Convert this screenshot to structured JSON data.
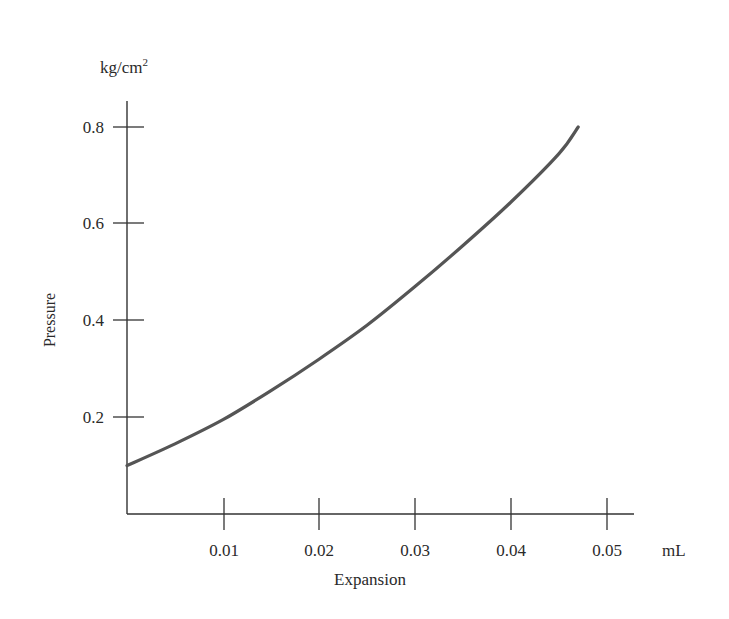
{
  "chart_data": {
    "type": "line",
    "title": "",
    "xlabel": "Expansion",
    "ylabel": "Pressure",
    "x_unit": "mL",
    "y_unit": "kg/cm²",
    "y_unit_base": "kg/cm",
    "y_unit_sup": "2",
    "xlim": [
      0,
      0.053
    ],
    "ylim": [
      0,
      0.8
    ],
    "x_ticks": [
      0.01,
      0.02,
      0.03,
      0.04,
      0.05
    ],
    "x_tick_labels": [
      "0.01",
      "0.02",
      "0.03",
      "0.04",
      "0.05"
    ],
    "y_ticks": [
      0.2,
      0.4,
      0.6,
      0.8
    ],
    "y_tick_labels": [
      "0.2",
      "0.4",
      "0.6",
      "0.8"
    ],
    "grid": false,
    "legend": null,
    "series": [
      {
        "name": "Pressure vs Expansion",
        "color": "#555555",
        "x": [
          0.0,
          0.005,
          0.01,
          0.015,
          0.02,
          0.025,
          0.03,
          0.035,
          0.04,
          0.045,
          0.047
        ],
        "y": [
          0.1,
          0.145,
          0.195,
          0.255,
          0.32,
          0.39,
          0.47,
          0.555,
          0.645,
          0.745,
          0.8
        ]
      }
    ]
  }
}
